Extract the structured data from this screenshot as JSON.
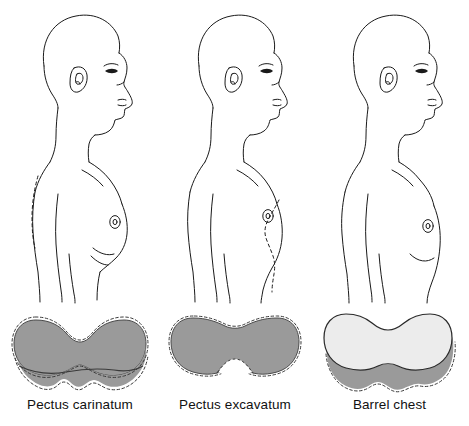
{
  "illustration": {
    "subject": "Chest wall deformities — lateral profile and transverse cross-section",
    "background_color": "#ffffff",
    "line_color": "#1a1a1a",
    "fill_gray": "#9a9a9a",
    "fill_light": "#ececec"
  },
  "panels": [
    {
      "id": "pectus-carinatum",
      "label": "Pectus carinatum",
      "profile": {
        "view": "lateral-profile-male-facing-right",
        "reference_line": "dashed",
        "reference_line_side": "posterior",
        "nipple_marker": true
      },
      "cross_section": {
        "shape": "heart-shaped-protruding-sternum",
        "fill": "#9a9a9a",
        "outline_style": "dashed-overlay",
        "costal_margin": "scalloped"
      }
    },
    {
      "id": "pectus-excavatum",
      "label": "Pectus excavatum",
      "profile": {
        "view": "lateral-profile-male-facing-right",
        "reference_line": "dashed",
        "reference_line_side": "anterior",
        "nipple_marker": true
      },
      "cross_section": {
        "shape": "flattened-with-central-depression",
        "fill": "#9a9a9a",
        "outline_style": "dashed-overlay",
        "costal_margin": "notched"
      }
    },
    {
      "id": "barrel-chest",
      "label": "Barrel chest",
      "profile": {
        "view": "lateral-profile-male-facing-right",
        "reference_line": "none",
        "reference_line_side": "",
        "nipple_marker": true
      },
      "cross_section": {
        "shape": "enlarged-rounded-over-normal",
        "fill": "#ececec",
        "fill_behind": "#9a9a9a",
        "outline_style": "solid-over-dashed",
        "costal_margin": "scalloped"
      }
    }
  ]
}
